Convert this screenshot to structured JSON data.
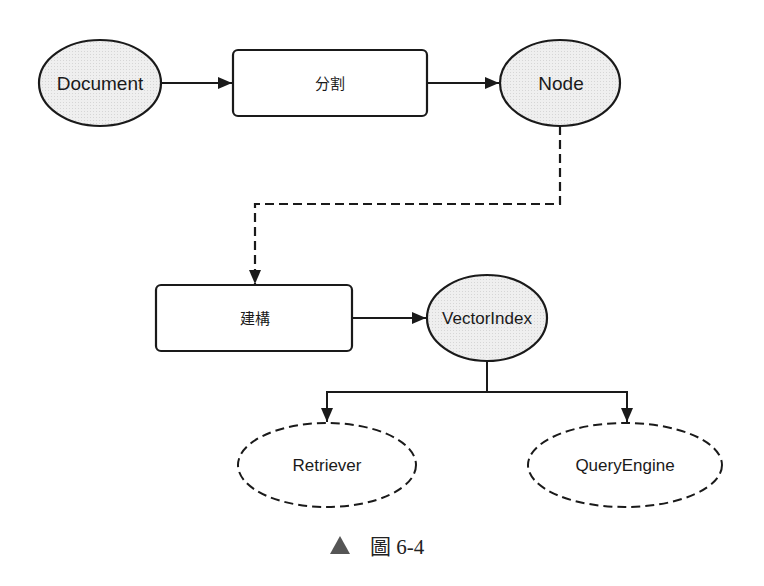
{
  "diagram": {
    "nodes": {
      "document": {
        "label": "Document",
        "shape": "ellipse",
        "style": "solid-filled"
      },
      "split": {
        "label": "分割",
        "shape": "rounded-rect",
        "style": "solid"
      },
      "node": {
        "label": "Node",
        "shape": "ellipse",
        "style": "solid-filled"
      },
      "build": {
        "label": "建構",
        "shape": "rounded-rect",
        "style": "solid"
      },
      "vector_index": {
        "label": "VectorIndex",
        "shape": "ellipse",
        "style": "solid-filled"
      },
      "retriever": {
        "label": "Retriever",
        "shape": "ellipse",
        "style": "dashed"
      },
      "query_engine": {
        "label": "QueryEngine",
        "shape": "ellipse",
        "style": "dashed"
      }
    },
    "edges": [
      {
        "from": "Document",
        "to": "分割",
        "style": "solid"
      },
      {
        "from": "分割",
        "to": "Node",
        "style": "solid"
      },
      {
        "from": "Node",
        "to": "建構",
        "style": "dashed"
      },
      {
        "from": "建構",
        "to": "VectorIndex",
        "style": "solid"
      },
      {
        "from": "VectorIndex",
        "to": "Retriever",
        "style": "solid"
      },
      {
        "from": "VectorIndex",
        "to": "QueryEngine",
        "style": "solid"
      }
    ],
    "colors": {
      "stroke": "#1a1a1a",
      "ellipse_fill": "#ebebeb",
      "caption_triangle": "#555555"
    }
  },
  "caption": {
    "marker": "▲",
    "text": "圖 6-4"
  }
}
